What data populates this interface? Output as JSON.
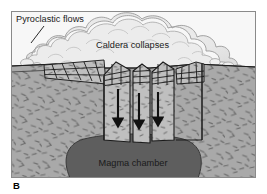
{
  "figure": {
    "panel_letter": "B",
    "caption_labels": [
      {
        "id": "pyroclastic",
        "text": "Pyroclastic flows",
        "x": 16,
        "y": 22,
        "anchor": "start",
        "size": 9.2,
        "color": "#1a1a1a"
      },
      {
        "id": "caldera",
        "text": "Caldera collapses",
        "x": 96,
        "y": 48,
        "anchor": "start",
        "size": 9.2,
        "color": "#1a1a1a"
      },
      {
        "id": "magma",
        "text": "Magma chamber",
        "x": 133,
        "y": 166,
        "anchor": "middle",
        "size": 9.2,
        "color": "#1a1a1a"
      }
    ],
    "frame": {
      "x": 11,
      "y": 11,
      "width": 245,
      "height": 167,
      "border_color": "#8a8a8a",
      "border_width": 1
    },
    "colors": {
      "sky": "#f7f7f7",
      "cloud_fill": "#e8e8e8",
      "cloud_light": "#f2f2f2",
      "cloud_outline": "#9a9a9a",
      "bedrock": "#a8a8a8",
      "bedrock_speckle": "#6e6e6e",
      "block_fill": "#bdbdbd",
      "block_outline": "#1a1a1a",
      "magma": "#5e5e5e",
      "magma_outline": "#3c3c3c",
      "arrow": "#111111",
      "frame_border": "#8a8a8a",
      "leader_line": "#2a2a2a",
      "panel_letter_color": "#000000"
    },
    "arrows": [
      {
        "id": "subsidence-arrow-1",
        "x": 118,
        "y_top": 89,
        "y_bottom": 125
      },
      {
        "id": "subsidence-arrow-2",
        "x": 139,
        "y_top": 93,
        "y_bottom": 127
      },
      {
        "id": "subsidence-arrow-3",
        "x": 158,
        "y_top": 92,
        "y_bottom": 124
      }
    ],
    "leader_line": {
      "id": "pyroclastic-leader",
      "x1": 44,
      "y1": 26,
      "x2": 31,
      "y2": 43
    },
    "panel_letter_pos": {
      "x": 13,
      "y": 189,
      "size": 9.5
    },
    "ground_level_y": 66,
    "scene_description": "Cross-section of a caldera collapse: pyroclastic flow cloud above, tilted fault blocks subsiding into an emptying magma chamber"
  }
}
